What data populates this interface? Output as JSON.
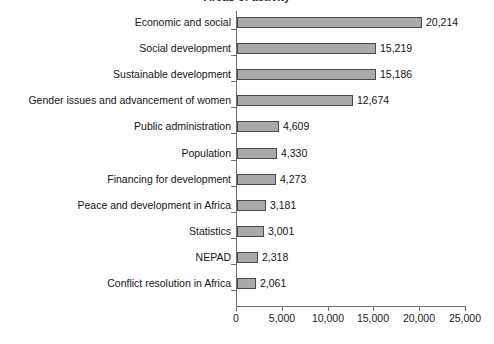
{
  "chart_data": {
    "type": "bar",
    "orientation": "horizontal",
    "title": "Areas of activity",
    "xlabel": "",
    "ylabel": "",
    "xlim": [
      0,
      25000
    ],
    "xticks": [
      "0",
      "5,000",
      "10,000",
      "15,000",
      "20,000",
      "25,000"
    ],
    "xtick_values": [
      0,
      5000,
      10000,
      15000,
      20000,
      25000
    ],
    "grid": false,
    "legend": null,
    "bar_color": "#a9a9a9",
    "bar_border_color": "#4a4a4a",
    "axis_color": "#6f6f6f",
    "categories": [
      "Economic and social",
      "Social development",
      "Sustainable development",
      "Gender issues and advancement of women",
      "Public administration",
      "Population",
      "Financing for development",
      "Peace and development in Africa",
      "Statistics",
      "NEPAD",
      "Conflict resolution in Africa"
    ],
    "values": [
      20214,
      15219,
      15186,
      12674,
      4609,
      4330,
      4273,
      3181,
      3001,
      2318,
      2061
    ],
    "value_labels": [
      "20,214",
      "15,219",
      "15,186",
      "12,674",
      "4,609",
      "4,330",
      "4,273",
      "3,181",
      "3,001",
      "2,318",
      "2,061"
    ]
  }
}
